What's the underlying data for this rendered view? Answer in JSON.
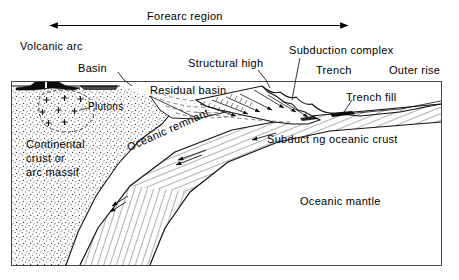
{
  "figure": {
    "type": "geologic-cross-section",
    "frame": {
      "x": 12,
      "y": 82,
      "width": 429,
      "height": 183
    }
  },
  "scale_bar": {
    "label": "Forearc region",
    "left_arrow_x": 48,
    "right_arrow_x": 350,
    "y": 25,
    "double_headed": true
  },
  "labels": {
    "forearc_region": "Forearc region",
    "volcanic_arc": "Volcanic arc",
    "basin": "Basin",
    "plutons": "Plutons",
    "residual_basin": "Residual basin",
    "structural_high": "Structural high",
    "subduction_complex": "Subduction complex",
    "trench": "Trench",
    "outer_rise": "Outer rise",
    "trench_fill": "Trench fill",
    "oceanic_remnant": "Oceanic remnant",
    "continental_crust_line1": "Continental",
    "continental_crust_line2": "crust or",
    "continental_crust_line3": "arc massif",
    "subducting_oceanic_crust": "Subduct ng oceanic crust",
    "oceanic_mantle": "Oceanic mantle"
  },
  "units": [
    {
      "name": "volcanic-arc-edifice",
      "fill": "black",
      "pattern": "solid",
      "description": "black volcano cone with white central conduit"
    },
    {
      "name": "continental-crust",
      "fill": "white",
      "pattern": "stipple",
      "description": "dense stippled arc massif"
    },
    {
      "name": "plutons",
      "fill": "white",
      "pattern": "plus-symbols",
      "description": "plus signs inside dashed outline"
    },
    {
      "name": "residual-basin",
      "fill": "white",
      "pattern": "light-stipple-dashed-strata",
      "description": "basin fill with dashed bedding"
    },
    {
      "name": "subduction-complex",
      "fill": "white",
      "pattern": "imbricate-thrusts",
      "description": "accretionary wedge with thrust slices"
    },
    {
      "name": "trench-fill",
      "fill": "black",
      "pattern": "solid",
      "description": "small black wedge in trench axis"
    },
    {
      "name": "subducting-oceanic-crust",
      "fill": "white",
      "pattern": "hatched",
      "description": "hatched slab dipping landward"
    },
    {
      "name": "oceanic-mantle",
      "fill": "white",
      "pattern": "blank",
      "description": "unornamented region beneath slab"
    }
  ],
  "colors": {
    "ink": "#000000",
    "background": "#ffffff",
    "solid_fill": "#111111",
    "stipple": "#4a4a4a",
    "thin_line": "#222222"
  },
  "leaders": [
    {
      "from": "Basin",
      "to": "arc-trench-break-shelf"
    },
    {
      "from": "Plutons",
      "to": "pluton-body"
    },
    {
      "from": "Structural high",
      "to": "wedge-crest"
    },
    {
      "from": "Subduction complex",
      "to": "accretionary-wedge"
    },
    {
      "from": "Trench fill",
      "to": "black-trench-wedge"
    }
  ]
}
